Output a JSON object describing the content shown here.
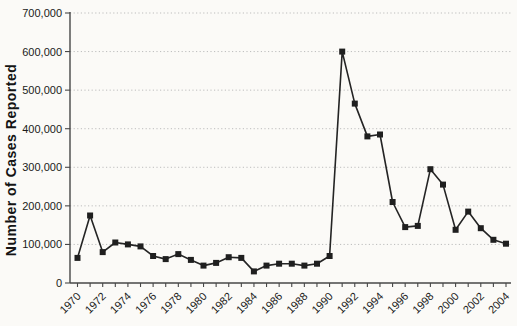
{
  "chart_data": {
    "type": "line",
    "ylabel": "Number of Cases Reported",
    "xlabel": "",
    "x": [
      1970,
      1971,
      1972,
      1973,
      1974,
      1975,
      1976,
      1977,
      1978,
      1979,
      1980,
      1981,
      1982,
      1983,
      1984,
      1985,
      1986,
      1987,
      1988,
      1989,
      1990,
      1991,
      1992,
      1993,
      1994,
      1995,
      1996,
      1997,
      1998,
      1999,
      2000,
      2001,
      2002,
      2003,
      2004
    ],
    "values": [
      65000,
      175000,
      80000,
      105000,
      100000,
      95000,
      70000,
      62000,
      75000,
      60000,
      45000,
      52000,
      67000,
      65000,
      30000,
      45000,
      50000,
      50000,
      45000,
      50000,
      70000,
      600000,
      465000,
      380000,
      385000,
      210000,
      145000,
      148000,
      295000,
      255000,
      138000,
      185000,
      142000,
      112000,
      102000
    ],
    "series": [
      {
        "name": "Number of Cases Reported",
        "marker": "square"
      }
    ],
    "ylim": [
      0,
      700000
    ],
    "y_ticks": [
      {
        "v": 0,
        "label": "0"
      },
      {
        "v": 100000,
        "label": "100,000"
      },
      {
        "v": 200000,
        "label": "200,000"
      },
      {
        "v": 300000,
        "label": "300,000"
      },
      {
        "v": 400000,
        "label": "400,000"
      },
      {
        "v": 500000,
        "label": "500,000"
      },
      {
        "v": 600000,
        "label": "600,000"
      },
      {
        "v": 700000,
        "label": "700,000"
      }
    ],
    "x_tick_labels": [
      "1970",
      "1972",
      "1974",
      "1976",
      "1978",
      "1980",
      "1982",
      "1984",
      "1986",
      "1988",
      "1990",
      "1992",
      "1994",
      "1996",
      "1998",
      "2000",
      "2002",
      "2004"
    ],
    "x_label_step": 2,
    "x_label_rotation_deg": -45,
    "x_minor_ticks_every_year": true,
    "grid": "horizontal-dotted",
    "legend": "none",
    "line_color": "#242424",
    "marker_color": "#1f1f1f",
    "grid_color": "#bdbdbd",
    "axis_color": "#474747",
    "text_color": "#1a1a1a",
    "background": "#fbfaf7"
  }
}
